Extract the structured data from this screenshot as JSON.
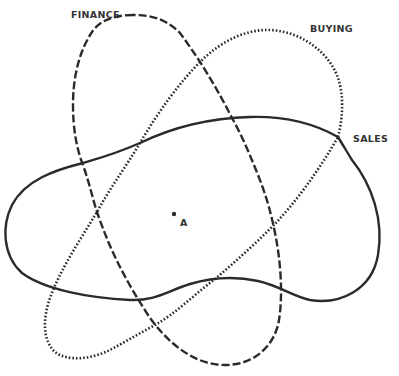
{
  "diagram": {
    "type": "overlapping-sets",
    "sets": [
      {
        "id": "finance",
        "label": "FINANCE",
        "line_style": "dashed"
      },
      {
        "id": "buying",
        "label": "BUYING",
        "line_style": "dotted"
      },
      {
        "id": "sales",
        "label": "SALES",
        "line_style": "solid"
      }
    ],
    "point": {
      "label": "A"
    },
    "colors": {
      "stroke": "#2a2a2a",
      "text": "#333333",
      "background": "#ffffff"
    }
  }
}
